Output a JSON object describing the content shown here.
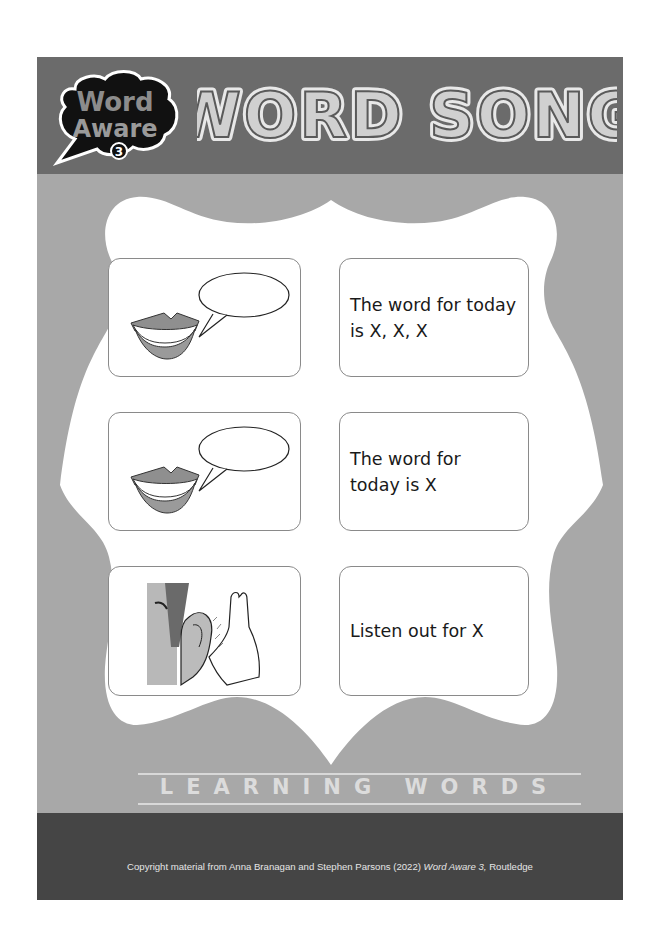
{
  "header": {
    "logo": {
      "line1": "Word",
      "line2": "Aware",
      "badge": "3"
    },
    "title": "WORD SONG"
  },
  "cards": [
    {
      "icon": "speaking-lips-speech-bubble-icon",
      "text": "The word for today is X, X, X",
      "lines": [
        "The word for today",
        "is X, X, X"
      ]
    },
    {
      "icon": "speaking-lips-speech-bubble-icon",
      "text": "The word for today is X",
      "lines": [
        "The word for",
        "today is X"
      ]
    },
    {
      "icon": "hand-cupped-to-ear-listening-icon",
      "text": "Listen out for X",
      "lines": [
        "Listen out for X"
      ]
    }
  ],
  "section_label": "LEARNING WORDS",
  "footer": {
    "copyright_prefix": "Copyright material from Anna Branagan and Stephen Parsons (2022) ",
    "book_title": "Word Aware 3,",
    "publisher": " Routledge"
  },
  "colors": {
    "header_bg": "#6b6b6b",
    "body_bg": "#a8a8a8",
    "footer_bg": "#454545",
    "frame_fill": "#ffffff",
    "card_border": "#8a8a8a"
  }
}
